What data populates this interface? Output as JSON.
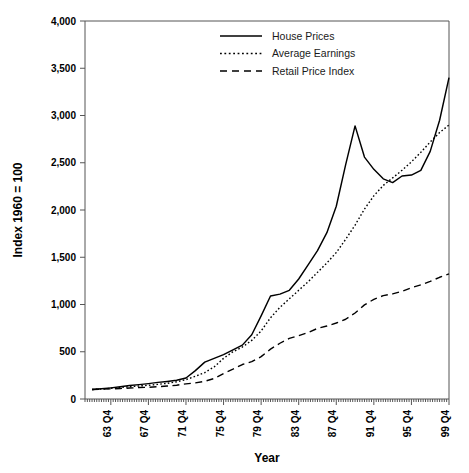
{
  "chart_data": {
    "type": "line",
    "title": "",
    "xlabel": "Year",
    "ylabel": "Index 1960 = 100",
    "ylim": [
      0,
      4000
    ],
    "ytick_values": [
      0,
      500,
      1000,
      1500,
      2000,
      2500,
      3000,
      3500,
      4000
    ],
    "ytick_labels": [
      "0",
      "500",
      "1,000",
      "1,500",
      "2,000",
      "2,500",
      "3,000",
      "3,500",
      "4,000"
    ],
    "grid": false,
    "legend_position": "top-right",
    "x_start_quarter": "1961 Q1",
    "x_end_quarter": "1999 Q4",
    "xtick_labels": [
      "63 Q4",
      "67 Q4",
      "71 Q4",
      "75 Q4",
      "79 Q4",
      "83 Q4",
      "87 Q4",
      "91 Q4",
      "95 Q4",
      "99 Q4"
    ],
    "xtick_years": [
      1963,
      1967,
      1971,
      1975,
      1979,
      1983,
      1987,
      1991,
      1995,
      1999
    ],
    "minor_tick_interval_quarters": 1,
    "series": [
      {
        "name": "House Prices",
        "style": "solid",
        "color": "#000000",
        "x": [
          1961,
          1962,
          1963,
          1964,
          1965,
          1966,
          1967,
          1968,
          1969,
          1970,
          1971,
          1972,
          1973,
          1974,
          1975,
          1976,
          1977,
          1978,
          1979,
          1980,
          1981,
          1982,
          1983,
          1984,
          1985,
          1986,
          1987,
          1988,
          1989,
          1990,
          1991,
          1992,
          1993,
          1994,
          1995,
          1996,
          1997,
          1998,
          1999
        ],
        "values": [
          100,
          108,
          118,
          130,
          142,
          152,
          163,
          176,
          186,
          198,
          222,
          300,
          390,
          430,
          470,
          520,
          570,
          680,
          880,
          1090,
          1110,
          1150,
          1270,
          1420,
          1570,
          1760,
          2040,
          2480,
          2890,
          2560,
          2430,
          2330,
          2290,
          2360,
          2370,
          2420,
          2620,
          2950,
          3400
        ]
      },
      {
        "name": "Average Earnings",
        "style": "dotted",
        "color": "#000000",
        "x": [
          1961,
          1962,
          1963,
          1964,
          1965,
          1966,
          1967,
          1968,
          1969,
          1970,
          1971,
          1972,
          1973,
          1974,
          1975,
          1976,
          1977,
          1978,
          1979,
          1980,
          1981,
          1982,
          1983,
          1984,
          1985,
          1986,
          1987,
          1988,
          1989,
          1990,
          1991,
          1992,
          1993,
          1994,
          1995,
          1996,
          1997,
          1998,
          1999
        ],
        "values": [
          100,
          106,
          113,
          122,
          130,
          138,
          145,
          155,
          166,
          182,
          205,
          240,
          280,
          340,
          430,
          500,
          550,
          620,
          720,
          860,
          970,
          1060,
          1150,
          1240,
          1340,
          1440,
          1550,
          1690,
          1840,
          2010,
          2150,
          2260,
          2340,
          2420,
          2510,
          2610,
          2720,
          2820,
          2900
        ]
      },
      {
        "name": "Retail Price Index",
        "style": "dashed",
        "color": "#000000",
        "x": [
          1961,
          1962,
          1963,
          1964,
          1965,
          1966,
          1967,
          1968,
          1969,
          1970,
          1971,
          1972,
          1973,
          1974,
          1975,
          1976,
          1977,
          1978,
          1979,
          1980,
          1981,
          1982,
          1983,
          1984,
          1985,
          1986,
          1987,
          1988,
          1989,
          1990,
          1991,
          1992,
          1993,
          1994,
          1995,
          1996,
          1997,
          1998,
          1999
        ],
        "values": [
          100,
          104,
          107,
          111,
          116,
          121,
          124,
          130,
          137,
          146,
          160,
          171,
          187,
          217,
          270,
          315,
          365,
          395,
          448,
          528,
          590,
          641,
          670,
          704,
          747,
          772,
          804,
          844,
          910,
          996,
          1055,
          1094,
          1112,
          1139,
          1178,
          1207,
          1245,
          1288,
          1325
        ]
      }
    ]
  },
  "legend": {
    "items": [
      {
        "label": "House Prices",
        "style": "solid"
      },
      {
        "label": "Average Earnings",
        "style": "dotted"
      },
      {
        "label": "Retail Price Index",
        "style": "dashed"
      }
    ]
  },
  "axes": {
    "y_title": "Index 1960 = 100",
    "x_title": "Year"
  }
}
